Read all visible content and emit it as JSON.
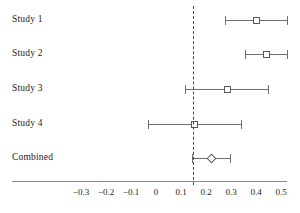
{
  "chart_data": {
    "type": "forest",
    "title": "",
    "xlabel": "",
    "ylabel": "",
    "xlim": [
      -0.35,
      0.55
    ],
    "grid": false,
    "legend": "none",
    "reference_line": {
      "value": 0.148,
      "style": "dashed"
    },
    "xticks": [
      -0.3,
      -0.2,
      -0.1,
      0,
      0.1,
      0.2,
      0.3,
      0.4,
      0.5
    ],
    "xtick_labels": [
      "−0.3",
      "−0.2",
      "−0.1",
      "0",
      "0.1",
      "0.2",
      "0.3",
      "0.4",
      "0.5"
    ],
    "categories": [
      "Study 1",
      "Study 2",
      "Study 3",
      "Study 4",
      "Combined"
    ],
    "rows": [
      {
        "label": "Study 1",
        "estimate": 0.4,
        "ci_low": 0.276,
        "ci_high": 0.524,
        "marker": "square"
      },
      {
        "label": "Study 2",
        "estimate": 0.44,
        "ci_low": 0.356,
        "ci_high": 0.524,
        "marker": "square"
      },
      {
        "label": "Study 3",
        "estimate": 0.284,
        "ci_low": 0.116,
        "ci_high": 0.448,
        "marker": "square"
      },
      {
        "label": "Study 4",
        "estimate": 0.152,
        "ci_low": -0.032,
        "ci_high": 0.34,
        "marker": "square"
      },
      {
        "label": "Combined",
        "estimate": 0.22,
        "ci_low": 0.144,
        "ci_high": 0.296,
        "marker": "diamond"
      }
    ]
  }
}
